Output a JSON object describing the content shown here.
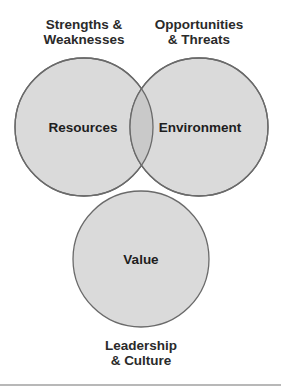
{
  "diagram": {
    "type": "venn",
    "colors": {
      "circle_fill": "#dadada",
      "overlap_fill": "#c9c9c9",
      "stroke": "#6a6a6a",
      "text": "#222222",
      "rule": "#b8b8b8"
    },
    "circles": [
      {
        "id": "resources",
        "label": "Resources",
        "cx": 84,
        "cy": 127,
        "r": 69
      },
      {
        "id": "environment",
        "label": "Environment",
        "cx": 199,
        "cy": 127,
        "r": 69
      },
      {
        "id": "value",
        "label": "Value",
        "cx": 141,
        "cy": 259,
        "r": 68
      }
    ],
    "outer_labels": {
      "resources": {
        "line1": "Strengths &",
        "line2": "Weaknesses"
      },
      "environment": {
        "line1": "Opportunities",
        "line2": "& Threats"
      },
      "value": {
        "line1": "Leadership",
        "line2": "& Culture"
      }
    }
  }
}
